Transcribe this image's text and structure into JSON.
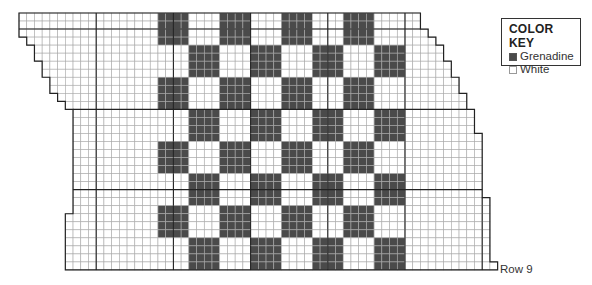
{
  "chart_data": {
    "type": "heatmap",
    "grid": {
      "origin_px": [
        19,
        13
      ],
      "cell_w": 7.72,
      "cell_h": 8.03,
      "rows": 32,
      "heavy_row_lines": [
        2,
        12,
        22
      ],
      "heavy_col_every": 10,
      "row_extents": [
        [
          0,
          52
        ],
        [
          0,
          52
        ],
        [
          0,
          53
        ],
        [
          1,
          54
        ],
        [
          2,
          55
        ],
        [
          2,
          55
        ],
        [
          3,
          56
        ],
        [
          3,
          56
        ],
        [
          4,
          57
        ],
        [
          4,
          57
        ],
        [
          5,
          58
        ],
        [
          6,
          58
        ],
        [
          7,
          59
        ],
        [
          7,
          59
        ],
        [
          7,
          59
        ],
        [
          7,
          60
        ],
        [
          7,
          60
        ],
        [
          7,
          60
        ],
        [
          7,
          60
        ],
        [
          7,
          60
        ],
        [
          7,
          60
        ],
        [
          7,
          60
        ],
        [
          7,
          60
        ],
        [
          7,
          61
        ],
        [
          7,
          61
        ],
        [
          6,
          61
        ],
        [
          6,
          61
        ],
        [
          6,
          61
        ],
        [
          6,
          61
        ],
        [
          6,
          61
        ],
        [
          6,
          61
        ],
        [
          6,
          62
        ]
      ]
    },
    "checkerboard": {
      "col_start": 18,
      "col_end": 50,
      "row_start": 0,
      "row_end": 32,
      "block_size": 4,
      "top_left_dark": true
    },
    "colors": {
      "dark": "#4a4a4a",
      "light": "#ffffff",
      "grid_line": "#aaaaaa",
      "heavy_line": "#222222"
    }
  },
  "key": {
    "title": "COLOR KEY",
    "items": [
      {
        "label": "Grenadine",
        "color": "#4a4a4a"
      },
      {
        "label": "White",
        "color": "#ffffff"
      }
    ]
  },
  "row_label": "Row 9"
}
